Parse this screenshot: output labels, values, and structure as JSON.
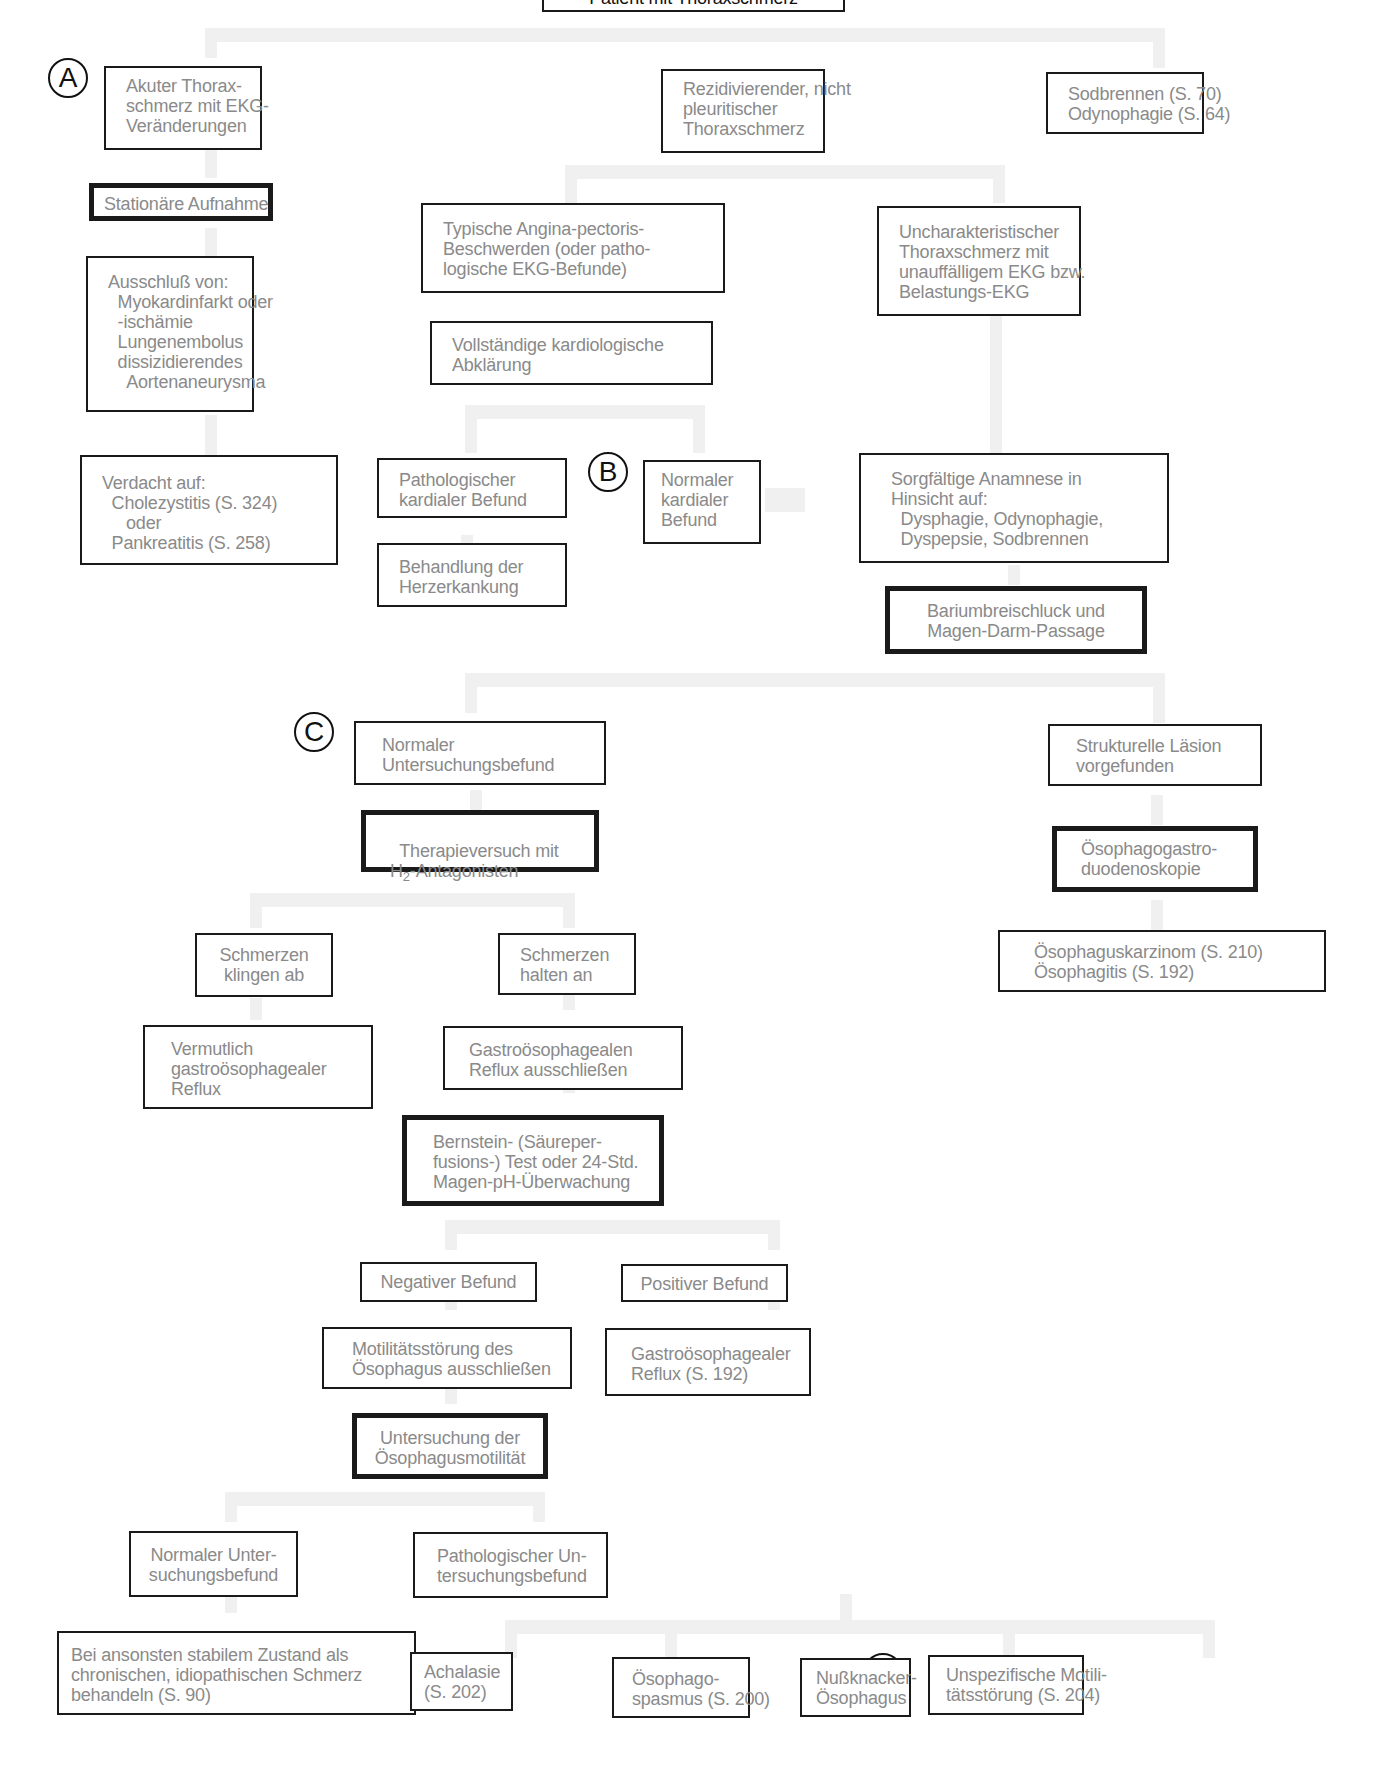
{
  "diagram": {
    "title": "Patient mit Thoraxschmerz",
    "markers": {
      "A": "A",
      "B": "B",
      "C": "C",
      "D": "D"
    },
    "nodes": {
      "akuter": "Akuter Thorax-\nschmerz mit EKG-\nVeränderungen",
      "rezidiv": "Rezidivierender, nicht\npleuritischer\nThoraxschmerz",
      "sodbrennen": "Sodbrennen (S. 70)\nOdynophagie (S. 64)",
      "stationaer": "Stationäre Aufnahme",
      "typische": "Typische Angina-pectoris-\nBeschwerden (oder patho-\nlogische EKG-Befunde)",
      "unchar": "Uncharakteristischer\nThoraxschmerz mit\nunauffälligem EKG bzw.\nBelastungs-EKG",
      "ausschluss": "Ausschluß von:\n  Myokardinfarkt oder\n  -ischämie\n  Lungenembolus\n  dissizidierendes\n    Aortenaneurysma",
      "vollstaendig": "Vollständige kardiologische\nAbklärung",
      "verdacht": "Verdacht auf:\n  Cholezystitis (S. 324)\n     oder\n  Pankreatitis (S. 258)",
      "path_kardial": "Pathologischer\nkardialer Befund",
      "normal_kardial": "Normaler\nkardialer\nBefund",
      "sorgfaeltig": "Sorgfältige Anamnese in\nHinsicht auf:\n  Dysphagie, Odynophagie,\n  Dyspepsie, Sodbrennen",
      "behandlung": "Behandlung der\nHerzerkankung",
      "barium": "Bariumbreischluck und\nMagen-Darm-Passage",
      "normal_unters": "Normaler\nUntersuchungsbefund",
      "strukturell": "Strukturelle Läsion\nvorgefunden",
      "therapie_line1": "Therapieversuch mit",
      "therapie_h": "H",
      "therapie_sub": "2",
      "therapie_rest": "-Antagonisten",
      "oesophagogastro": "Ösophagogastro-\nduodenoskopie",
      "schmerz_ab": "Schmerzen\nklingen ab",
      "schmerz_an": "Schmerzen\nhalten an",
      "karzinom": "Ösophaguskarzinom (S. 210)\nÖsophagitis (S. 192)",
      "vermutlich": "Vermutlich\ngastroösophagealer\nReflux",
      "gastro_aus": "Gastroösophagealen\nReflux ausschließen",
      "bernstein": "Bernstein- (Säureper-\nfusions-) Test oder 24-Std.\nMagen-pH-Überwachung",
      "negativ": "Negativer Befund",
      "positiv": "Positiver Befund",
      "motilitaet_aus": "Motilitätsstörung des\nÖsophagus ausschließen",
      "gastro_reflux": "Gastroösophagealer\nReflux (S. 192)",
      "untersuchung_mot": "Untersuchung der\nÖsophagusmotilität",
      "normal_unter2": "Normaler Unter-\nsuchungsbefund",
      "path_unter": "Pathologischer Un-\ntersuchungsbefund",
      "bei_ansonsten": "Bei ansonsten stabilem Zustand als\nchronischen, idiopathischen Schmerz\nbehandeln (S. 90)",
      "achalasie": "Achalasie\n(S. 202)",
      "spasmus": "Ösophago-\nspasmus (S. 200)",
      "nussknacker": "Nußknacker-\nÖsophagus",
      "unspezifisch": "Unspezifische Motili-\ntätsstörung (S. 204)"
    }
  }
}
